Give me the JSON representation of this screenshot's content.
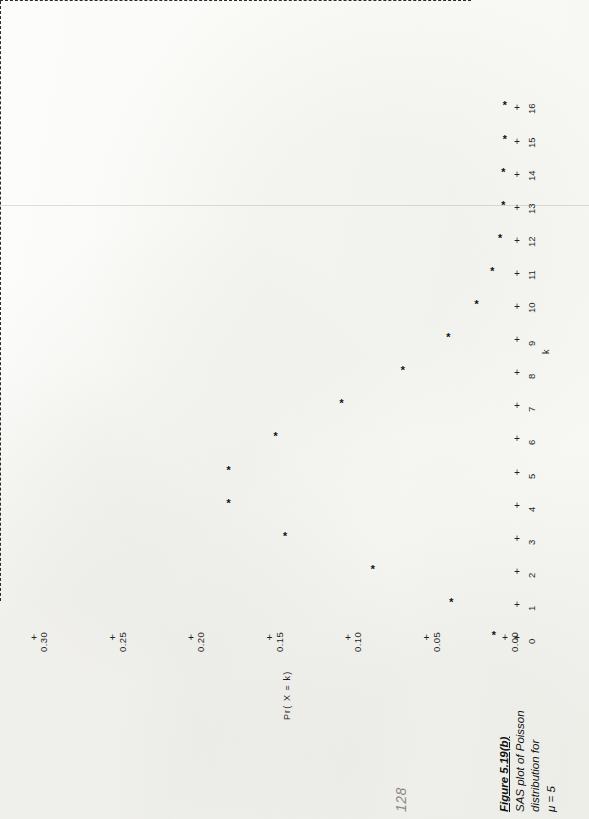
{
  "page": {
    "page_number": "128"
  },
  "caption": {
    "figure_label": "Figure 5.19(b)",
    "line1": "SAS plot of Poisson",
    "line2": "distribution for",
    "line3": "μ = 5"
  },
  "chart_data": {
    "type": "scatter",
    "title": "",
    "xlabel": "k",
    "ylabel": "Pr( X = k)",
    "marker": "*",
    "grid": false,
    "legend": null,
    "orientation_note": "printed page rotated 90 degrees counter-clockwise in the scan",
    "x": [
      0,
      1,
      2,
      3,
      4,
      5,
      6,
      7,
      8,
      9,
      10,
      11,
      12,
      13,
      14,
      15,
      16
    ],
    "xtick_labels": [
      "0",
      "1",
      "2",
      "3",
      "4",
      "5",
      "6",
      "7",
      "8",
      "9",
      "10",
      "11",
      "12",
      "13",
      "14",
      "15",
      "16"
    ],
    "xlim": [
      0,
      16
    ],
    "values": [
      0.007,
      0.034,
      0.084,
      0.14,
      0.176,
      0.176,
      0.146,
      0.104,
      0.065,
      0.036,
      0.018,
      0.008,
      0.003,
      0.001,
      0.001,
      0.0,
      0.0
    ],
    "ytick_labels": [
      "0.00",
      "0.05",
      "0.10",
      "0.15",
      "0.20",
      "0.25",
      "0.30"
    ],
    "ytick_values": [
      0.0,
      0.05,
      0.1,
      0.15,
      0.2,
      0.25,
      0.3
    ],
    "ylim": [
      0.0,
      0.3
    ],
    "tick_glyph": "+"
  }
}
